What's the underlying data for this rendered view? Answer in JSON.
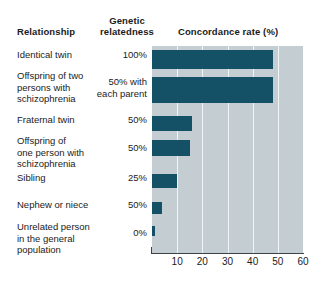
{
  "header": {
    "col_relationship": "Relationship",
    "col_relatedness_line1": "Genetic",
    "col_relatedness_line2": "relatedness",
    "col_concordance": "Concordance rate (%)"
  },
  "colors": {
    "bar": "#145066",
    "plot_background": "#c3cdd2",
    "gridline": "#f2f5f6",
    "axis": "#3c4347",
    "text": "#1b1b1b",
    "page_background": "#ffffff"
  },
  "chart_data": {
    "type": "bar",
    "orientation": "horizontal",
    "title": "Concordance rate (%)",
    "xlabel": "Concordance rate (%)",
    "ylabel": "Relationship",
    "xlim": [
      0,
      60
    ],
    "xticks": [
      10,
      20,
      30,
      40,
      50,
      60
    ],
    "grid": true,
    "legend": null,
    "categories": [
      "Identical twin",
      "Offspring of two persons with schizophrenia",
      "Fraternal twin",
      "Offspring of one person with schizophrenia",
      "Sibling",
      "Nephew or niece",
      "Unrelated person in the general population"
    ],
    "values": [
      48,
      48,
      16,
      15,
      10,
      4,
      1
    ],
    "genetic_relatedness": [
      "100%",
      "50% with each parent",
      "50%",
      "50%",
      "25%",
      "50%",
      "0%"
    ]
  },
  "rows": [
    {
      "label_lines": [
        "Identical twin"
      ],
      "relatedness_lines": [
        "100%"
      ],
      "value": 48
    },
    {
      "label_lines": [
        "Offspring of two",
        "persons with",
        "schizophrenia"
      ],
      "relatedness_lines": [
        "50% with",
        "each parent"
      ],
      "value": 48
    },
    {
      "label_lines": [
        "Fraternal twin"
      ],
      "relatedness_lines": [
        "50%"
      ],
      "value": 16
    },
    {
      "label_lines": [
        "Offspring of",
        "one person with",
        "schizophrenia"
      ],
      "relatedness_lines": [
        "50%"
      ],
      "value": 15
    },
    {
      "label_lines": [
        "Sibling"
      ],
      "relatedness_lines": [
        "25%"
      ],
      "value": 10
    },
    {
      "label_lines": [
        "Nephew or niece"
      ],
      "relatedness_lines": [
        "50%"
      ],
      "value": 4
    },
    {
      "label_lines": [
        "Unrelated person",
        "in the general",
        "population"
      ],
      "relatedness_lines": [
        "0%"
      ],
      "value": 1
    }
  ]
}
